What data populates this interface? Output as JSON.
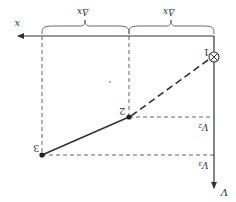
{
  "diagram": {
    "orientation": "rotated-180",
    "colors": {
      "line": "#333333",
      "dashed": "#555555",
      "background": "#ffffff"
    },
    "axes": {
      "horizontal_label": "x",
      "vertical_label": "V"
    },
    "spacing_labels": [
      "Δx",
      "Δx"
    ],
    "points": [
      {
        "label": "1",
        "marker": "circled-x"
      },
      {
        "label": "2",
        "marker": "dot"
      },
      {
        "label": "3",
        "marker": "dot"
      }
    ],
    "level_labels": [
      "V₂",
      "V₃"
    ]
  }
}
